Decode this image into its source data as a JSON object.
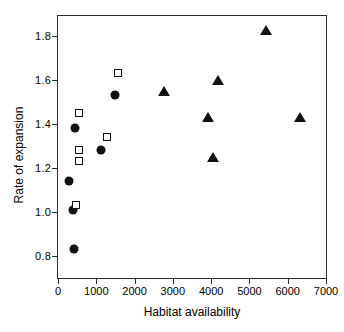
{
  "chart_data": {
    "type": "scatter",
    "title": "",
    "xlabel": "Habitat availability",
    "ylabel": "Rate of expansion",
    "xlim": [
      0,
      7000
    ],
    "ylim": [
      0.7,
      1.89
    ],
    "xticks": [
      0,
      1000,
      2000,
      3000,
      4000,
      5000,
      6000,
      7000
    ],
    "xticklabels": [
      "0",
      "1000",
      "2000",
      "3000",
      "4000",
      "5000",
      "6000",
      "7000"
    ],
    "yticks": [
      0.8,
      1.0,
      1.2,
      1.4,
      1.6,
      1.8
    ],
    "yticklabels": [
      "0.8",
      "1.0",
      "1.2",
      "1.4",
      "1.6",
      "1.8"
    ],
    "grid": false,
    "legend": "none",
    "marker_color": "#111111",
    "frame_color": "#2b2b2b",
    "series": [
      {
        "name": "filled-circle",
        "marker": "circle",
        "filled": true,
        "points": [
          {
            "x": 440,
            "y": 1.38
          },
          {
            "x": 300,
            "y": 1.14
          },
          {
            "x": 380,
            "y": 1.01
          },
          {
            "x": 420,
            "y": 0.83
          },
          {
            "x": 1130,
            "y": 1.28
          },
          {
            "x": 1490,
            "y": 1.53
          }
        ]
      },
      {
        "name": "open-square",
        "marker": "square",
        "filled": false,
        "points": [
          {
            "x": 540,
            "y": 1.45
          },
          {
            "x": 560,
            "y": 1.28
          },
          {
            "x": 560,
            "y": 1.23
          },
          {
            "x": 480,
            "y": 1.03
          },
          {
            "x": 1290,
            "y": 1.34
          },
          {
            "x": 1560,
            "y": 1.63
          }
        ]
      },
      {
        "name": "filled-triangle",
        "marker": "triangle",
        "filled": true,
        "points": [
          {
            "x": 2760,
            "y": 1.555
          },
          {
            "x": 3920,
            "y": 1.435
          },
          {
            "x": 4180,
            "y": 1.605
          },
          {
            "x": 4060,
            "y": 1.255
          },
          {
            "x": 5430,
            "y": 1.83
          },
          {
            "x": 6330,
            "y": 1.435
          }
        ]
      }
    ]
  }
}
